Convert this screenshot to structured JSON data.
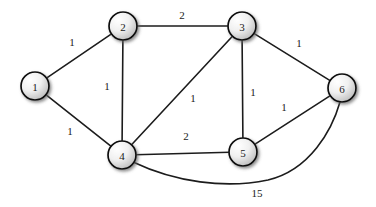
{
  "figure": {
    "type": "undirected-weighted-graph",
    "background_color": "#ffffff",
    "node_fill_light": "#fdfdfd",
    "node_fill_dark": "#b5b5b5",
    "node_stroke_color": "#0d0d0d",
    "edge_color": "#1c1c1c"
  },
  "chart_data": {
    "type": "diagram",
    "title": "",
    "nodes": [
      {
        "id": "1",
        "label": "1",
        "x": 35,
        "y": 86,
        "r": 14
      },
      {
        "id": "2",
        "label": "2",
        "x": 123,
        "y": 26,
        "r": 14
      },
      {
        "id": "3",
        "label": "3",
        "x": 242,
        "y": 26,
        "r": 14
      },
      {
        "id": "4",
        "label": "4",
        "x": 122,
        "y": 155,
        "r": 14
      },
      {
        "id": "5",
        "label": "5",
        "x": 243,
        "y": 152,
        "r": 14
      },
      {
        "id": "6",
        "label": "6",
        "x": 342,
        "y": 88,
        "r": 14
      }
    ],
    "edges": [
      {
        "from": "1",
        "to": "2",
        "weight": "1",
        "label_x": 72,
        "label_y": 42,
        "curved": false
      },
      {
        "from": "1",
        "to": "4",
        "weight": "1",
        "label_x": 70,
        "label_y": 131,
        "curved": false
      },
      {
        "from": "2",
        "to": "3",
        "weight": "2",
        "label_x": 182,
        "label_y": 15,
        "curved": false
      },
      {
        "from": "2",
        "to": "4",
        "weight": "1",
        "label_x": 107,
        "label_y": 86,
        "curved": false
      },
      {
        "from": "3",
        "to": "4",
        "weight": "1",
        "label_x": 193,
        "label_y": 98,
        "curved": false
      },
      {
        "from": "3",
        "to": "5",
        "weight": "1",
        "label_x": 253,
        "label_y": 92,
        "curved": false
      },
      {
        "from": "3",
        "to": "6",
        "weight": "1",
        "label_x": 299,
        "label_y": 43,
        "curved": false
      },
      {
        "from": "4",
        "to": "5",
        "weight": "2",
        "label_x": 186,
        "label_y": 136,
        "curved": false
      },
      {
        "from": "5",
        "to": "6",
        "weight": "1",
        "label_x": 284,
        "label_y": 107,
        "curved": false
      },
      {
        "from": "4",
        "to": "6",
        "weight": "15",
        "label_x": 257,
        "label_y": 193,
        "curved": true,
        "path": "M 133 162 C 175 182 225 189 268 180 C 310 170 332 130 340 102"
      }
    ]
  }
}
